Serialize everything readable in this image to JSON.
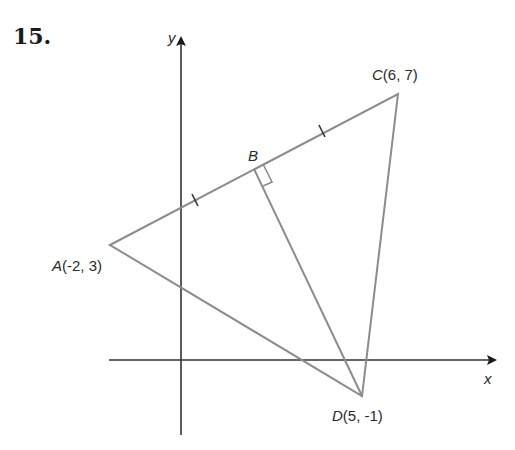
{
  "problem": {
    "number": "15."
  },
  "axes": {
    "x_label": "x",
    "y_label": "y",
    "origin_px": [
      181,
      360
    ],
    "x_axis_px": {
      "from": 109,
      "to": 495,
      "y": 360
    },
    "y_axis_px": {
      "from": 435,
      "to": 38,
      "x": 181
    },
    "axis_color": "#333333"
  },
  "points": {
    "A": {
      "name": "A",
      "coords": "(-2, 3)",
      "px": [
        110,
        245
      ]
    },
    "B": {
      "name": "B",
      "coords": "",
      "px": [
        254,
        169
      ]
    },
    "C": {
      "name": "C",
      "coords": "(6, 7)",
      "px": [
        398,
        94
      ]
    },
    "D": {
      "name": "D",
      "coords": "(5, -1)",
      "px": [
        362,
        396
      ]
    }
  },
  "segments": [
    {
      "from": "A",
      "to": "C"
    },
    {
      "from": "C",
      "to": "D"
    },
    {
      "from": "D",
      "to": "A"
    },
    {
      "from": "B",
      "to": "D"
    }
  ],
  "markers": {
    "right_angle_at": "B",
    "congruence_ticks": [
      {
        "segment": "AB",
        "px": [
          195,
          200
        ]
      },
      {
        "segment": "BC",
        "px": [
          322,
          131
        ]
      }
    ]
  },
  "colors": {
    "figure_line": "#8c8c8c",
    "axis": "#333333",
    "text": "#2a2a2a"
  }
}
